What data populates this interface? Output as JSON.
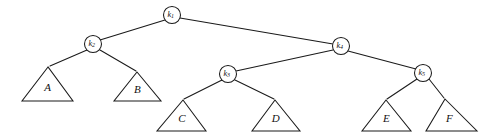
{
  "figure": {
    "type": "binary-tree-diagram",
    "background_color": "#ffffff",
    "stroke_color": "#1a1a1a",
    "fill_color": "#ffffff"
  },
  "nodes": [
    {
      "id": "k1",
      "label": "k",
      "subscript": "1",
      "cx": 172,
      "cy": 15,
      "r": 8.5
    },
    {
      "id": "k2",
      "label": "k",
      "subscript": "2",
      "cx": 93,
      "cy": 44,
      "r": 8.5
    },
    {
      "id": "k4",
      "label": "k",
      "subscript": "4",
      "cx": 341,
      "cy": 46,
      "r": 8.5
    },
    {
      "id": "k3",
      "label": "k",
      "subscript": "3",
      "cx": 228,
      "cy": 74,
      "r": 8.5
    },
    {
      "id": "k5",
      "label": "k",
      "subscript": "5",
      "cx": 423,
      "cy": 73,
      "r": 8.5
    }
  ],
  "subtrees": [
    {
      "id": "A",
      "label": "A",
      "apex_x": 48,
      "apex_y": 67,
      "left_x": 22,
      "right_x": 73,
      "base_y": 101
    },
    {
      "id": "B",
      "label": "B",
      "apex_x": 137,
      "apex_y": 72,
      "left_x": 114,
      "right_x": 161,
      "base_y": 101
    },
    {
      "id": "C",
      "label": "C",
      "apex_x": 183,
      "apex_y": 100,
      "left_x": 157,
      "right_x": 206,
      "base_y": 131
    },
    {
      "id": "D",
      "label": "D",
      "apex_x": 275,
      "apex_y": 100,
      "left_x": 252,
      "right_x": 300,
      "base_y": 131
    },
    {
      "id": "E",
      "label": "E",
      "apex_x": 386,
      "apex_y": 100,
      "left_x": 362,
      "right_x": 411,
      "base_y": 131
    },
    {
      "id": "F",
      "label": "F",
      "apex_x": 445,
      "apex_y": 99,
      "left_x": 426,
      "right_x": 477,
      "base_y": 131
    }
  ],
  "edges": [
    {
      "id": "k1-k2",
      "from": "k1",
      "to": "k2",
      "x1": 165,
      "y1": 20,
      "x2": 100,
      "y2": 40
    },
    {
      "id": "k1-k4",
      "from": "k1",
      "to": "k4",
      "x1": 180,
      "y1": 18,
      "x2": 333,
      "y2": 44
    },
    {
      "id": "k2-A",
      "from": "k2",
      "to": "A",
      "x1": 87,
      "y1": 50,
      "x2": 50,
      "y2": 66
    },
    {
      "id": "k2-B",
      "from": "k2",
      "to": "B",
      "x1": 100,
      "y1": 50,
      "x2": 136,
      "y2": 71
    },
    {
      "id": "k4-k3",
      "from": "k4",
      "to": "k3",
      "x1": 333,
      "y1": 50,
      "x2": 236,
      "y2": 71
    },
    {
      "id": "k4-k5",
      "from": "k4",
      "to": "k5",
      "x1": 348,
      "y1": 51,
      "x2": 416,
      "y2": 69
    },
    {
      "id": "k3-C",
      "from": "k3",
      "to": "C",
      "x1": 222,
      "y1": 80,
      "x2": 184,
      "y2": 99
    },
    {
      "id": "k3-D",
      "from": "k3",
      "to": "D",
      "x1": 235,
      "y1": 80,
      "x2": 274,
      "y2": 99
    },
    {
      "id": "k5-E",
      "from": "k5",
      "to": "E",
      "x1": 417,
      "y1": 79,
      "x2": 387,
      "y2": 99
    },
    {
      "id": "k5-F",
      "from": "k5",
      "to": "F",
      "x1": 429,
      "y1": 79,
      "x2": 444,
      "y2": 98
    }
  ],
  "labels": {
    "k1": "k1",
    "k2": "k2",
    "k3": "k3",
    "k4": "k4",
    "k5": "k5",
    "A": "A",
    "B": "B",
    "C": "C",
    "D": "D",
    "E": "E",
    "F": "F"
  }
}
